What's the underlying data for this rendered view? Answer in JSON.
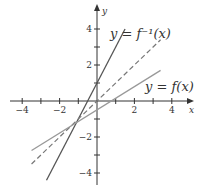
{
  "chart_data": {
    "type": "line",
    "title": "",
    "xlabel": "x",
    "ylabel": "y",
    "xlim": [
      -4.5,
      4.5
    ],
    "ylim": [
      -4.6,
      4.6
    ],
    "x_ticks": [
      -4,
      -3,
      -2,
      -1,
      1,
      2,
      3,
      4
    ],
    "x_tick_labels": [
      "-4",
      "-2",
      "2",
      "4"
    ],
    "x_tick_label_values": [
      -4,
      -2,
      2,
      4
    ],
    "y_ticks": [
      -4,
      -3,
      -2,
      -1,
      1,
      2,
      3,
      4
    ],
    "y_tick_labels": [
      "4",
      "2",
      "-2",
      "-4"
    ],
    "y_tick_label_values": [
      4,
      2,
      -2,
      -4
    ],
    "grid": false,
    "series": [
      {
        "name": "y = f^{-1}(x)",
        "label_text": "y = f⁻¹(x)",
        "style": "solid",
        "color": "#555555",
        "x": [
          -2.7,
          1.5
        ],
        "y": [
          -4.4,
          4.0
        ]
      },
      {
        "name": "y = x",
        "label_text": "",
        "style": "dashed",
        "color": "#777777",
        "x": [
          -3.5,
          3.4
        ],
        "y": [
          -3.5,
          3.4
        ]
      },
      {
        "name": "y = f(x)",
        "label_text": "y = f(x)",
        "style": "solid",
        "color": "#999999",
        "x": [
          -3.5,
          3.4
        ],
        "y": [
          -2.75,
          1.7
        ]
      }
    ],
    "annotations": [
      {
        "text": "y = f⁻¹(x)",
        "x": 0.8,
        "y": 3.8
      },
      {
        "text": "y = f(x)",
        "x": 2.6,
        "y": 0.8
      }
    ],
    "intersection": {
      "x": -1,
      "y": -1
    }
  }
}
